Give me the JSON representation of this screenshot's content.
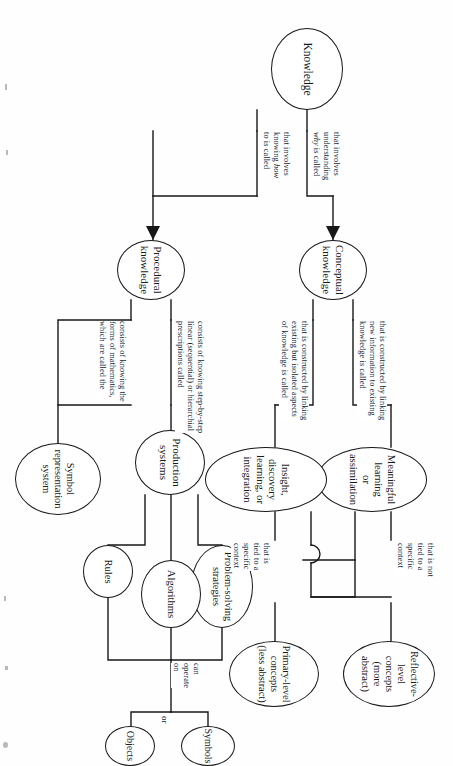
{
  "document": {
    "kind": "concept-map",
    "orientation": "rotated-90-clockwise",
    "title": "Knowledge"
  },
  "nodes": {
    "knowledge": "Knowledge",
    "conceptual_knowledge_l1": "Conceptual",
    "conceptual_knowledge_l2": "knowledge",
    "procedural_knowledge_l1": "Procedural",
    "procedural_knowledge_l2": "knowledge",
    "meaningful_learning_l1": "Meaningful learning",
    "meaningful_learning_l2": "or assimilation",
    "insight_discovery_l1": "Insight, discovery",
    "insight_discovery_l2": "learning, or integration",
    "reflective_concepts_l1": "Reflective-level",
    "reflective_concepts_l2": "concepts",
    "reflective_concepts_l3": "(more abstract)",
    "primary_concepts_l1": "Primary-level",
    "primary_concepts_l2": "concepts",
    "primary_concepts_l3": "(less abstract)",
    "production_systems_l1": "Production",
    "production_systems_l2": "systems",
    "symbol_system_l1": "Symbol",
    "symbol_system_l2": "representation",
    "symbol_system_l3": "system",
    "problem_solving_l1": "Problem-solving",
    "problem_solving_l2": "strategies",
    "algorithms": "Algorithms",
    "rules": "Rules",
    "objects": "Objects",
    "symbols": "Symbols"
  },
  "labels": {
    "involves_understanding_why": {
      "l1": "that involves",
      "l2": "understanding",
      "l3_em": "why",
      "l3_rest": " is called"
    },
    "involves_knowing_how": {
      "l1": "that involves",
      "l2_rest": "knowing ",
      "l2_em": "how",
      "l3": "to is called"
    },
    "constructed_new_information": {
      "l1": "that is constructed by linking",
      "l2": "new information to existing",
      "l3": "knowledge is called"
    },
    "constructed_isolated_aspects": {
      "l1": "that is constructed by linking",
      "l2": "existing but isolated aspects",
      "l3": "of knowledge is called"
    },
    "not_tied_to_context": {
      "l1": "that is not",
      "l2": "tied to a",
      "l3": "specific",
      "l4": "context"
    },
    "tied_to_context": {
      "l1": "that is",
      "l2": "tied to a",
      "l3": "specific",
      "l4": "context"
    },
    "step_by_step": {
      "l1": "consists of knowing step-by-step",
      "l2": "linear (sequential) or hierarchial",
      "l3": "prescriptions called"
    },
    "forms_of_mathematics": {
      "l1": "consists of knowing the",
      "l2": "forms of mathematics,",
      "l3": "which are called the"
    },
    "can_operate_on": {
      "l1": "can",
      "l2": "operate",
      "l3": "on"
    },
    "or": "or"
  },
  "colors": {
    "ink": "#171717",
    "paper": "#fefefe"
  }
}
